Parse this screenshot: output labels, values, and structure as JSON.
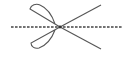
{
  "icon": {
    "name": "scissors-cut-line",
    "stroke_color": "#555555",
    "dash_color": "#444444",
    "background": "#ffffff"
  }
}
